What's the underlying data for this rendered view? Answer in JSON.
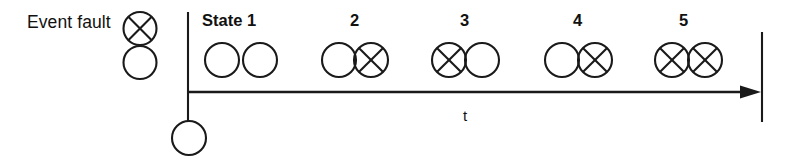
{
  "legend": {
    "label": "Event fault",
    "fault_symbol": "crossed-circle",
    "event_symbol": "open-circle"
  },
  "axis": {
    "label": "t",
    "arrow_direction": "right"
  },
  "states": [
    {
      "label": "State 1",
      "number": "1",
      "symbols": [
        "open-circle",
        "open-circle"
      ]
    },
    {
      "label": "2",
      "number": "2",
      "symbols": [
        "open-circle",
        "crossed-circle"
      ]
    },
    {
      "label": "3",
      "number": "3",
      "symbols": [
        "crossed-circle",
        "open-circle"
      ]
    },
    {
      "label": "4",
      "number": "4",
      "symbols": [
        "open-circle",
        "crossed-circle"
      ]
    },
    {
      "label": "5",
      "number": "5",
      "symbols": [
        "crossed-circle",
        "crossed-circle"
      ]
    }
  ],
  "origin_marker": {
    "symbol": "open-circle"
  },
  "colors": {
    "ink": "#1a1a1a",
    "background": "#ffffff"
  }
}
